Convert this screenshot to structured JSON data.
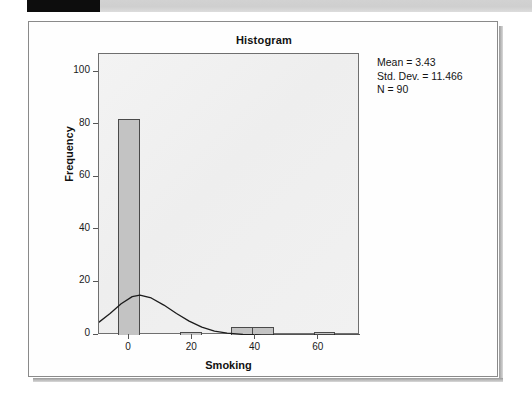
{
  "scanner_band": {
    "black_block_name": "redacted-block"
  },
  "chart": {
    "title": "Histogram",
    "xlabel": "Smoking",
    "ylabel": "Frequency",
    "stats": {
      "mean_line": "Mean = 3.43",
      "stddev_line": "Std. Dev. = 11.466",
      "n_line": "N = 90"
    },
    "colors": {
      "bar_fill": "#c3c3c3",
      "bar_border": "#4a4a4a",
      "plot_background": "#f1f1f1",
      "plot_border": "#6f6f6f",
      "curve": "#1c1c1c",
      "frame_border": "#8a8a8a",
      "text": "#141414"
    }
  },
  "chart_data": {
    "type": "bar",
    "title": "Histogram",
    "xlabel": "Smoking",
    "ylabel": "Frequency",
    "xlim": [
      -9.5,
      73.0
    ],
    "ylim": [
      0,
      107
    ],
    "xticks": [
      0,
      20,
      40,
      60
    ],
    "yticks": [
      0,
      20,
      40,
      60,
      80,
      100
    ],
    "grid": false,
    "legend": false,
    "bin_width": 6.5,
    "bins": [
      {
        "center": 0.0,
        "left": -3.25,
        "right": 3.25,
        "frequency": 82
      },
      {
        "center": 19.5,
        "left": 16.25,
        "right": 22.75,
        "frequency": 1
      },
      {
        "center": 35.75,
        "left": 32.5,
        "right": 39.0,
        "frequency": 3
      },
      {
        "center": 42.25,
        "left": 39.0,
        "right": 45.5,
        "frequency": 3
      },
      {
        "center": 61.75,
        "left": 58.5,
        "right": 65.0,
        "frequency": 1
      }
    ],
    "categories": [
      "0",
      "19.5",
      "35.75",
      "42.25",
      "61.75"
    ],
    "values": [
      82,
      1,
      3,
      3,
      1
    ],
    "normal_curve": {
      "shown": true,
      "mean": 3.43,
      "std_dev": 11.466,
      "n": 90,
      "peak_frequency": 15.2,
      "points": [
        {
          "x": -9.5,
          "y": 4.9
        },
        {
          "x": -6.0,
          "y": 8.2
        },
        {
          "x": -2.5,
          "y": 11.9
        },
        {
          "x": 1.0,
          "y": 14.6
        },
        {
          "x": 3.43,
          "y": 15.2
        },
        {
          "x": 7.0,
          "y": 14.1
        },
        {
          "x": 11.0,
          "y": 11.4
        },
        {
          "x": 15.0,
          "y": 8.2
        },
        {
          "x": 19.0,
          "y": 5.3
        },
        {
          "x": 23.0,
          "y": 3.0
        },
        {
          "x": 27.0,
          "y": 1.5
        },
        {
          "x": 31.0,
          "y": 0.7
        },
        {
          "x": 36.0,
          "y": 0.2
        },
        {
          "x": 42.0,
          "y": 0.05
        },
        {
          "x": 50.0,
          "y": 0.0
        },
        {
          "x": 73.0,
          "y": 0.0
        }
      ]
    },
    "annotations": [
      "Mean = 3.43",
      "Std. Dev. = 11.466",
      "N = 90"
    ]
  }
}
